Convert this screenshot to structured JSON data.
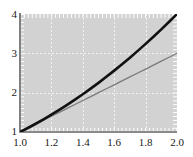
{
  "chart_data": {
    "type": "line",
    "title": "",
    "xlabel": "",
    "ylabel": "",
    "xlim": [
      1.0,
      2.0
    ],
    "ylim": [
      1,
      4
    ],
    "grid": true,
    "legend": "none",
    "background_color": "#d2d2d2",
    "gridline_color": "#f2f2f2",
    "axis_color": "#808080",
    "xticks": [
      "1.0",
      "1.2",
      "1.4",
      "1.6",
      "1.8",
      "2.0"
    ],
    "xtick_values": [
      1.0,
      1.2,
      1.4,
      1.6,
      1.8,
      2.0
    ],
    "yticks": [
      "1",
      "2",
      "3",
      "4"
    ],
    "ytick_values": [
      1,
      2,
      3,
      4
    ],
    "x": [
      1.0,
      1.05,
      1.1,
      1.15,
      1.2,
      1.25,
      1.3,
      1.35,
      1.4,
      1.45,
      1.5,
      1.55,
      1.6,
      1.65,
      1.7,
      1.75,
      1.8,
      1.85,
      1.9,
      1.95,
      2.0
    ],
    "series": [
      {
        "name": "x^2",
        "color": "#111111",
        "width": 2.6,
        "values": [
          1.0,
          1.1025,
          1.21,
          1.3225,
          1.44,
          1.5625,
          1.69,
          1.8225,
          1.96,
          2.1025,
          2.25,
          2.4025,
          2.56,
          2.7225,
          2.89,
          3.0625,
          3.24,
          3.4225,
          3.61,
          3.8025,
          4.0
        ]
      },
      {
        "name": "2x - 1",
        "color": "#7a7a7a",
        "width": 1.3,
        "values": [
          1.0,
          1.1,
          1.2,
          1.3,
          1.4,
          1.5,
          1.6,
          1.7,
          1.8,
          1.9,
          2.0,
          2.1,
          2.2,
          2.3,
          2.4,
          2.5,
          2.6,
          2.7,
          2.8,
          2.9,
          3.0
        ]
      }
    ]
  }
}
